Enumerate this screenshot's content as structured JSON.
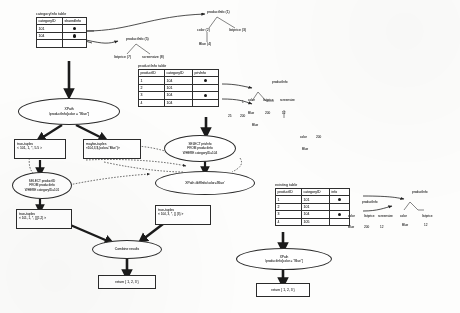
{
  "figure": {
    "kind": "diagram"
  },
  "tables": [
    {
      "id": "categoryinfo",
      "caption": "categoryInfo table",
      "columns": [
        "categoryID",
        "sharedInfo"
      ],
      "rows": [
        {
          "categoryID": "101",
          "sharedInfo": "blob"
        },
        {
          "categoryID": "104",
          "sharedInfo": "blob"
        },
        {
          "categoryID": "",
          "sharedInfo": ""
        }
      ]
    },
    {
      "id": "productinfo",
      "caption": "productInfo table",
      "columns": [
        "productID",
        "categoryID",
        "privInfo"
      ],
      "rows": [
        {
          "productID": "1",
          "categoryID": "104",
          "privInfo": "blob"
        },
        {
          "productID": "2",
          "categoryID": "101",
          "privInfo": ""
        },
        {
          "productID": "3",
          "categoryID": "104",
          "privInfo": "blob"
        },
        {
          "productID": "4",
          "categoryID": "104",
          "privInfo": ""
        }
      ]
    },
    {
      "id": "existing",
      "caption": "existing table",
      "columns": [
        "productID",
        "categoryID",
        "info"
      ],
      "rows": [
        {
          "productID": "1",
          "categoryID": "101",
          "info": "blob"
        },
        {
          "productID": "2",
          "categoryID": "101",
          "info": ""
        },
        {
          "productID": "3",
          "categoryID": "104",
          "info": "blob"
        },
        {
          "productID": "4",
          "categoryID": "105",
          "info": ""
        }
      ]
    }
  ],
  "trees": {
    "shared_top": {
      "root": "productInfo (1)",
      "children": [
        "color (2)",
        "listprice (3)"
      ],
      "leaf": "Blue (4)"
    },
    "shared_mid": {
      "root": "productInfo (5)",
      "children": [
        "listprice (7)",
        "screensize (8)"
      ]
    },
    "priv_right": {
      "root": "productInfo",
      "children": [
        "color",
        "listprice",
        "screensize"
      ],
      "values": [
        "Blue",
        "200",
        "12"
      ]
    },
    "priv_small": {
      "root": "productInfo",
      "children": [
        "color",
        "listprice"
      ],
      "values": [
        "Blue",
        "200"
      ]
    },
    "stub_values": [
      "25",
      "200",
      "Blue",
      "1",
      "200",
      "color",
      "Blue"
    ]
  },
  "operators": {
    "xpath_left": {
      "line1": "XPath",
      "line2": "/productInfo[color = \"Blue\"]"
    },
    "select_left": {
      "line1": "SELECT productID",
      "line2": "FROM productInfo",
      "line3": "WHERE categoryID=101"
    },
    "select_right": {
      "line1": "SELECT privInfo",
      "line2": "FROM productInfo",
      "line3": "WHERE categoryID=104"
    },
    "xpath_mid": {
      "line1": "XPath  /diffInfo/color='Blue'"
    },
    "combine": {
      "line1": "Combine results"
    },
    "xpath_right": {
      "line1": "XPath",
      "line2": "/productInfo[color = \"Blue\"]"
    }
  },
  "boxes": {
    "true_tuples_1": {
      "label": "true-tuples",
      "value": "< 101, 1, *, 5.5 >"
    },
    "maybe_tuples_1": {
      "label": "maybe-tuples",
      "value": "<104,3,$,(color=\"Blue\")>"
    },
    "true_tuples_2": {
      "label": "true-tuples",
      "value": "< 101, 1, *, {}{1,2} >"
    },
    "true_tuples_3": {
      "label": "true-tuples",
      "value": "< 104, 3, *, {} {3} >"
    },
    "return_left": {
      "value": "return { 1, 2, 3 }"
    },
    "return_right": {
      "value": "return { 1, 2, 3 }"
    }
  },
  "colors": {
    "ink": "#2b2b2b",
    "paper": "#fdfdfc",
    "blob": "#161616"
  }
}
